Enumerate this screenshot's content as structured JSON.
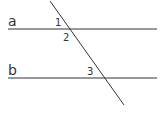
{
  "diagram": {
    "type": "parallel-lines-transversal",
    "lines": [
      {
        "id": "a",
        "label": "a",
        "x1": 8,
        "y1": 29,
        "x2": 157,
        "y2": 29
      },
      {
        "id": "b",
        "label": "b",
        "x1": 8,
        "y1": 78,
        "x2": 157,
        "y2": 78
      },
      {
        "id": "transversal",
        "label": "",
        "x1": 50,
        "y1": 1,
        "x2": 124,
        "y2": 105
      }
    ],
    "angle_labels": [
      {
        "id": "1",
        "text": "1",
        "x": 55,
        "y": 26
      },
      {
        "id": "2",
        "text": "2",
        "x": 63,
        "y": 41
      },
      {
        "id": "3",
        "text": "3",
        "x": 87,
        "y": 75
      }
    ],
    "line_labels": {
      "a": {
        "text": "a",
        "x": 8,
        "y": 26
      },
      "b": {
        "text": "b",
        "x": 8,
        "y": 75
      }
    },
    "colors": {
      "stroke": "#333333",
      "text": "#333333",
      "background": "#ffffff"
    }
  }
}
